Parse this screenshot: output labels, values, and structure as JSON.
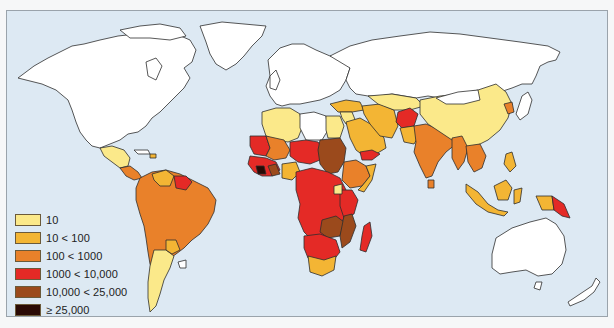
{
  "map": {
    "background_color": "#dde9f3",
    "no_data_color": "#ffffff",
    "legend": [
      {
        "label": "10",
        "color": "#fbe98a"
      },
      {
        "label": "10 < 100",
        "color": "#f3b534"
      },
      {
        "label": "100 < 1000",
        "color": "#e9812a"
      },
      {
        "label": "1000 < 10,000",
        "color": "#e42a26"
      },
      {
        "label": "10,000 < 25,000",
        "color": "#9b4a1c"
      },
      {
        "label": "≥ 25,000",
        "color": "#2a0a05"
      }
    ]
  }
}
